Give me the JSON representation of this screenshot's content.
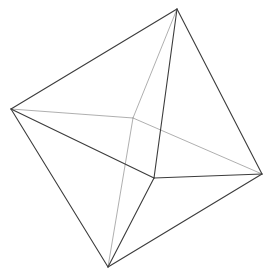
{
  "diagram": {
    "type": "wireframe-octahedron",
    "vertices": {
      "top": [
        177,
        9
      ],
      "left": [
        11,
        109
      ],
      "right": [
        262,
        174
      ],
      "bottom": [
        108,
        267
      ],
      "front": [
        154,
        178
      ],
      "back": [
        133,
        118
      ]
    },
    "edges_front": [
      [
        "top",
        "left"
      ],
      [
        "top",
        "right"
      ],
      [
        "top",
        "front"
      ],
      [
        "left",
        "front"
      ],
      [
        "front",
        "right"
      ],
      [
        "left",
        "bottom"
      ],
      [
        "bottom",
        "right"
      ],
      [
        "front",
        "bottom"
      ]
    ],
    "edges_hidden": [
      [
        "top",
        "back"
      ],
      [
        "left",
        "back"
      ],
      [
        "back",
        "right"
      ],
      [
        "back",
        "bottom"
      ]
    ],
    "colors": {
      "front": "#3c3c3c",
      "hidden": "#9a9a9a",
      "background": "#ffffff"
    }
  }
}
